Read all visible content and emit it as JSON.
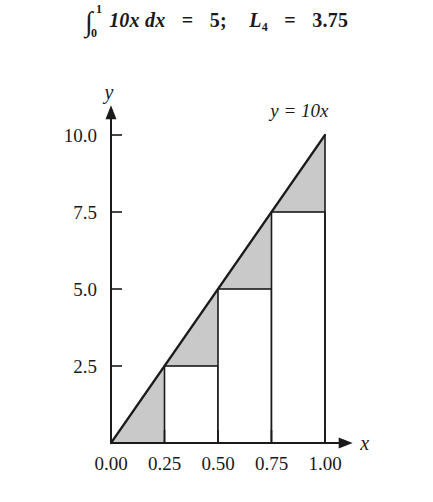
{
  "title": {
    "integral_symbol": "∫",
    "lower_limit": "0",
    "upper_limit": "1",
    "integrand": "10x dx",
    "equals": "=",
    "integral_value": "5;",
    "riemann_symbol": "L",
    "riemann_subscript": "4",
    "riemann_equals": "=",
    "riemann_value": "3.75",
    "full_text": "∫₀¹ 10x dx = 5;  L₄ = 3.75"
  },
  "chart_data": {
    "type": "area",
    "xlabel": "x",
    "ylabel": "y",
    "xlim": [
      0,
      1.12
    ],
    "ylim": [
      0,
      10.9
    ],
    "grid": false,
    "legend": "none",
    "function": {
      "label": "y = 10x",
      "expression": "10*x",
      "slope": 10,
      "intercept": 0,
      "label_position": {
        "x": 0.88,
        "y": 10.6
      }
    },
    "xticks": [
      0.0,
      0.25,
      0.5,
      0.75,
      1.0
    ],
    "xticklabels": [
      "0.00",
      "0.25",
      "0.50",
      "0.75",
      "1.00"
    ],
    "yticks": [
      2.5,
      5.0,
      7.5,
      10.0
    ],
    "yticklabels": [
      "2.5",
      "5.0",
      "7.5",
      "10.0"
    ],
    "riemann": {
      "rule": "left-endpoint",
      "n": 4,
      "width": 0.25,
      "left_edges": [
        0.0,
        0.25,
        0.5,
        0.75
      ],
      "right_edges": [
        0.25,
        0.5,
        0.75,
        1.0
      ],
      "heights": [
        0.0,
        2.5,
        5.0,
        7.5
      ],
      "areas": [
        0.0,
        0.625,
        1.25,
        1.875
      ],
      "sum": 3.75,
      "exact_area": 5,
      "shaded_region_label": "error region between line and rectangle tops",
      "rect_fill": "#ffffff",
      "shade_fill": "#c9c9c9",
      "stroke": "#1a1a1a"
    }
  }
}
